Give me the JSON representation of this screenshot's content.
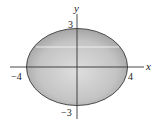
{
  "diagram": {
    "type": "ellipse-on-axes",
    "equation_hint": "x^2/16 + y^2/9 = 1",
    "axes": {
      "x_label": "x",
      "y_label": "y"
    },
    "ticks": {
      "x_neg": "−4",
      "x_pos": "4",
      "y_pos": "3",
      "y_neg": "−3"
    },
    "ellipse": {
      "semi_major": 4,
      "semi_minor": 3,
      "fill_light": "#d9d9d9",
      "fill_dark": "#9e9e9e",
      "stroke": "#4a4a4a"
    },
    "colors": {
      "axis": "#333333",
      "highlight": "#f4f4f4",
      "background": "#ffffff"
    }
  }
}
